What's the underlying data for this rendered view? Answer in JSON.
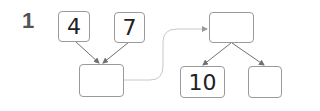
{
  "question_number": "1",
  "boxes": {
    "top_left": "4",
    "top_middle": "7",
    "sum_result": "",
    "split_source": "",
    "split_left": "10",
    "split_right": ""
  },
  "colors": {
    "border": "#9a9a9a",
    "arrow": "#707070",
    "connector": "#c8c8c8",
    "number": "#555555"
  }
}
